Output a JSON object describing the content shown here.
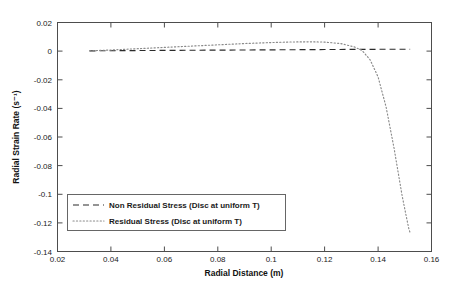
{
  "chart_data": {
    "type": "line",
    "title": "",
    "xlabel": "Radial Distance (m)",
    "ylabel": "Radial Strain Rate (s⁻¹)",
    "xlim": [
      0.02,
      0.16
    ],
    "ylim": [
      -0.14,
      0.02
    ],
    "xticks": [
      0.02,
      0.04,
      0.06,
      0.08,
      0.1,
      0.12,
      0.14,
      0.16
    ],
    "xtick_labels": [
      "0.02",
      "0.04",
      "0.06",
      "0.08",
      "0.1",
      "0.12",
      "0.14",
      "0.16"
    ],
    "yticks": [
      0.02,
      0,
      -0.02,
      -0.04,
      -0.06,
      -0.08,
      -0.1,
      -0.12,
      -0.14
    ],
    "ytick_labels": [
      "0.02",
      "0",
      "-0.02",
      "-0.04",
      "-0.06",
      "-0.08",
      "-0.1",
      "-0.12",
      "-0.14"
    ],
    "grid": false,
    "legend_position": "lower-left-inside",
    "series": [
      {
        "name": "Non Residual Stress (Disc at uniform T)",
        "style": "dashed",
        "color": "#2b2b2b",
        "x": [
          0.032,
          0.04,
          0.05,
          0.06,
          0.07,
          0.08,
          0.09,
          0.1,
          0.11,
          0.12,
          0.13,
          0.136,
          0.142,
          0.148,
          0.152
        ],
        "y": [
          0.0002,
          0.0003,
          0.0004,
          0.0005,
          0.0006,
          0.0007,
          0.0008,
          0.0009,
          0.001,
          0.0011,
          0.0012,
          0.0012,
          0.0013,
          0.0013,
          0.0013
        ]
      },
      {
        "name": "Residual Stress (Disc at uniform T)",
        "style": "dotted",
        "color": "#8a8a8a",
        "x": [
          0.032,
          0.04,
          0.05,
          0.06,
          0.07,
          0.08,
          0.09,
          0.1,
          0.108,
          0.115,
          0.12,
          0.126,
          0.131,
          0.134,
          0.137,
          0.14,
          0.143,
          0.146,
          0.149,
          0.1505,
          0.1515,
          0.152
        ],
        "y": [
          0.0002,
          0.0008,
          0.0017,
          0.0026,
          0.0035,
          0.0044,
          0.0053,
          0.006,
          0.0064,
          0.0065,
          0.0063,
          0.0053,
          0.003,
          0.0005,
          -0.006,
          -0.018,
          -0.039,
          -0.068,
          -0.101,
          -0.115,
          -0.124,
          -0.127
        ]
      }
    ],
    "legend_entries": [
      {
        "label": "Non Residual Stress (Disc at uniform T)",
        "style": "dashed"
      },
      {
        "label": "Residual Stress (Disc at uniform T)",
        "style": "dotted"
      }
    ]
  }
}
